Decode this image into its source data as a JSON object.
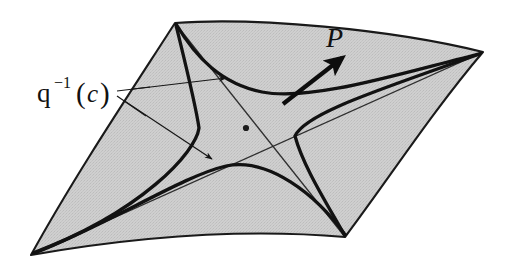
{
  "figure": {
    "caption_hidden": "",
    "domain_kind": "mathematical-diagram",
    "background_color": "#ffffff",
    "surface": {
      "name": "saddle-surface",
      "kind": "hyperbolic-paraboloid-patch",
      "fill_color": "#c8c8c8",
      "stroke_color": "#1a1a1a",
      "corners": [
        {
          "label": "top-left",
          "x": 175,
          "y": 23
        },
        {
          "label": "right",
          "x": 483,
          "y": 52
        },
        {
          "label": "bottom-right",
          "x": 345,
          "y": 237
        },
        {
          "label": "bottom-left",
          "x": 31,
          "y": 255
        }
      ],
      "saddle_point": {
        "x": 246,
        "y": 128
      }
    },
    "labels": [
      {
        "name": "preimage-label",
        "base": "q",
        "superscript": "−1",
        "open_paren": "(",
        "argument": "c",
        "close_paren": ")",
        "full_text": "q−1(c)",
        "x": 36,
        "y": 99
      },
      {
        "name": "vector-label",
        "full_text": "P",
        "style": "italic",
        "x": 330,
        "y": 40
      }
    ],
    "vector": {
      "name": "tangent-vector-P",
      "from": {
        "x": 283,
        "y": 104
      },
      "to": {
        "x": 346,
        "y": 55
      },
      "stroke_color": "#0d0d0d",
      "arrowhead": "solid-filled"
    },
    "leader_lines": [
      {
        "name": "leader-upper",
        "from": {
          "x": 117,
          "y": 91
        },
        "to": {
          "x": 228,
          "y": 78
        },
        "arrow_tip": {
          "x": 228,
          "y": 78
        }
      },
      {
        "name": "leader-lower",
        "from": {
          "x": 117,
          "y": 96
        },
        "to": {
          "x": 214,
          "y": 161
        },
        "arrow_tip": {
          "x": 214,
          "y": 161
        }
      }
    ],
    "level_curves": {
      "name": "level-set-branches",
      "stroke_color": "#121212",
      "count": 4,
      "description": "two hyperbola branch pairs asymptotic to the surface diagonals"
    },
    "asymptote_lines": {
      "name": "asymptote-diagonals",
      "stroke_color": "#2b2b2b",
      "count": 2,
      "description": "thin straight rulings crossing at the saddle point"
    }
  }
}
